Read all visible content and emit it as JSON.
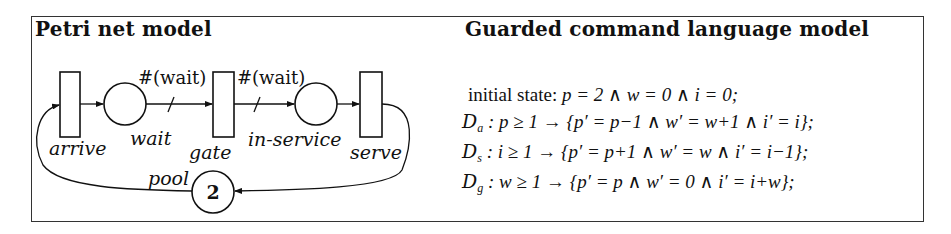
{
  "figure": {
    "left_panel": {
      "title": "Petri net model",
      "transitions": [
        {
          "id": "arrive",
          "label": "arrive"
        },
        {
          "id": "gate",
          "label": "gate"
        },
        {
          "id": "serve",
          "label": "serve"
        }
      ],
      "places": [
        {
          "id": "wait",
          "label": "wait",
          "tokens": ""
        },
        {
          "id": "in-service",
          "label": "in-service",
          "tokens": ""
        },
        {
          "id": "pool",
          "label": "pool",
          "tokens": "2"
        }
      ],
      "arc_weights": {
        "wait_to_gate": "#(wait)",
        "gate_to_in_service": "#(wait)"
      },
      "arcs": [
        {
          "from": "arrive",
          "to": "wait"
        },
        {
          "from": "wait",
          "to": "gate",
          "weight": "#(wait)"
        },
        {
          "from": "gate",
          "to": "in-service",
          "weight": "#(wait)"
        },
        {
          "from": "in-service",
          "to": "serve"
        },
        {
          "from": "serve",
          "to": "pool"
        },
        {
          "from": "pool",
          "to": "arrive"
        }
      ]
    },
    "right_panel": {
      "title": "Guarded command language model",
      "initial": {
        "label": "initial state:",
        "expr": "p = 2 ∧ w = 0 ∧ i = 0;"
      },
      "commands": [
        {
          "name": "D",
          "sub": "a",
          "guard": ": p ≥ 1 → ",
          "update": "{p′ = p−1 ∧ w′ = w+1 ∧ i′ = i};"
        },
        {
          "name": "D",
          "sub": "s",
          "guard": ": i ≥ 1 → ",
          "update": "{p′ = p+1 ∧ w′ = w ∧ i′ = i−1};"
        },
        {
          "name": "D",
          "sub": "g",
          "guard": ": w ≥ 1 → ",
          "update": "{p′ = p ∧ w′ = 0 ∧ i′ = i+w};"
        }
      ]
    }
  }
}
